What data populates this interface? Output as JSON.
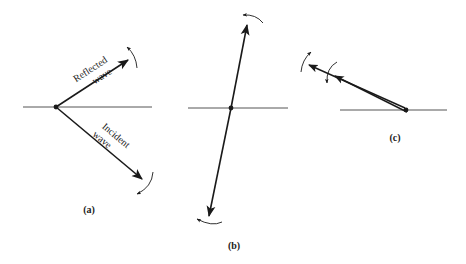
{
  "diagram": {
    "colors": {
      "ink": "#1a1a1a",
      "axis": "#555555",
      "background": "#ffffff"
    },
    "panels": [
      {
        "id": "a",
        "caption": "(a)",
        "labels": {
          "reflected_line1": "Reflected",
          "reflected_line2": "wave",
          "incident_line1": "Incident",
          "incident_line2": "wave"
        }
      },
      {
        "id": "b",
        "caption": "(b)"
      },
      {
        "id": "c",
        "caption": "(c)"
      }
    ]
  }
}
